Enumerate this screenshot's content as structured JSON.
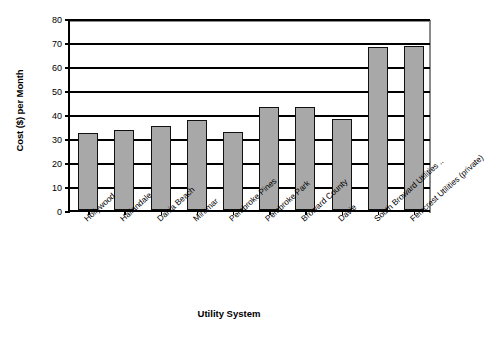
{
  "chart_data": {
    "type": "bar",
    "title": "",
    "xlabel": "Utility System",
    "ylabel": "Cost ($) per Month",
    "categories": [
      "Hollywood",
      "Hallandale",
      "Dania Beach",
      "Miramar",
      "Pembroke Pines",
      "Pembroke Park",
      "Broward County",
      "Davie",
      "South Broward Utilities ..",
      "Femcrest Utilities (private)"
    ],
    "values": [
      32,
      33.5,
      35,
      37.5,
      32.5,
      43,
      43,
      38,
      68,
      68.5
    ],
    "ylim": [
      0,
      80
    ],
    "ytick_step": 10,
    "yticks": [
      0,
      10,
      20,
      30,
      40,
      50,
      60,
      70,
      80
    ],
    "ytick_labels": [
      "0",
      "10",
      "20",
      "30",
      "40",
      "50",
      "60",
      "70",
      "80"
    ],
    "grid": true,
    "grid_axis": "y",
    "legend": false,
    "legend_position": "none",
    "bar_fill_color": "#a8a8a8",
    "bar_edge_color": "#111111",
    "axis_color": "#000000",
    "background_color": "#ffffff"
  }
}
